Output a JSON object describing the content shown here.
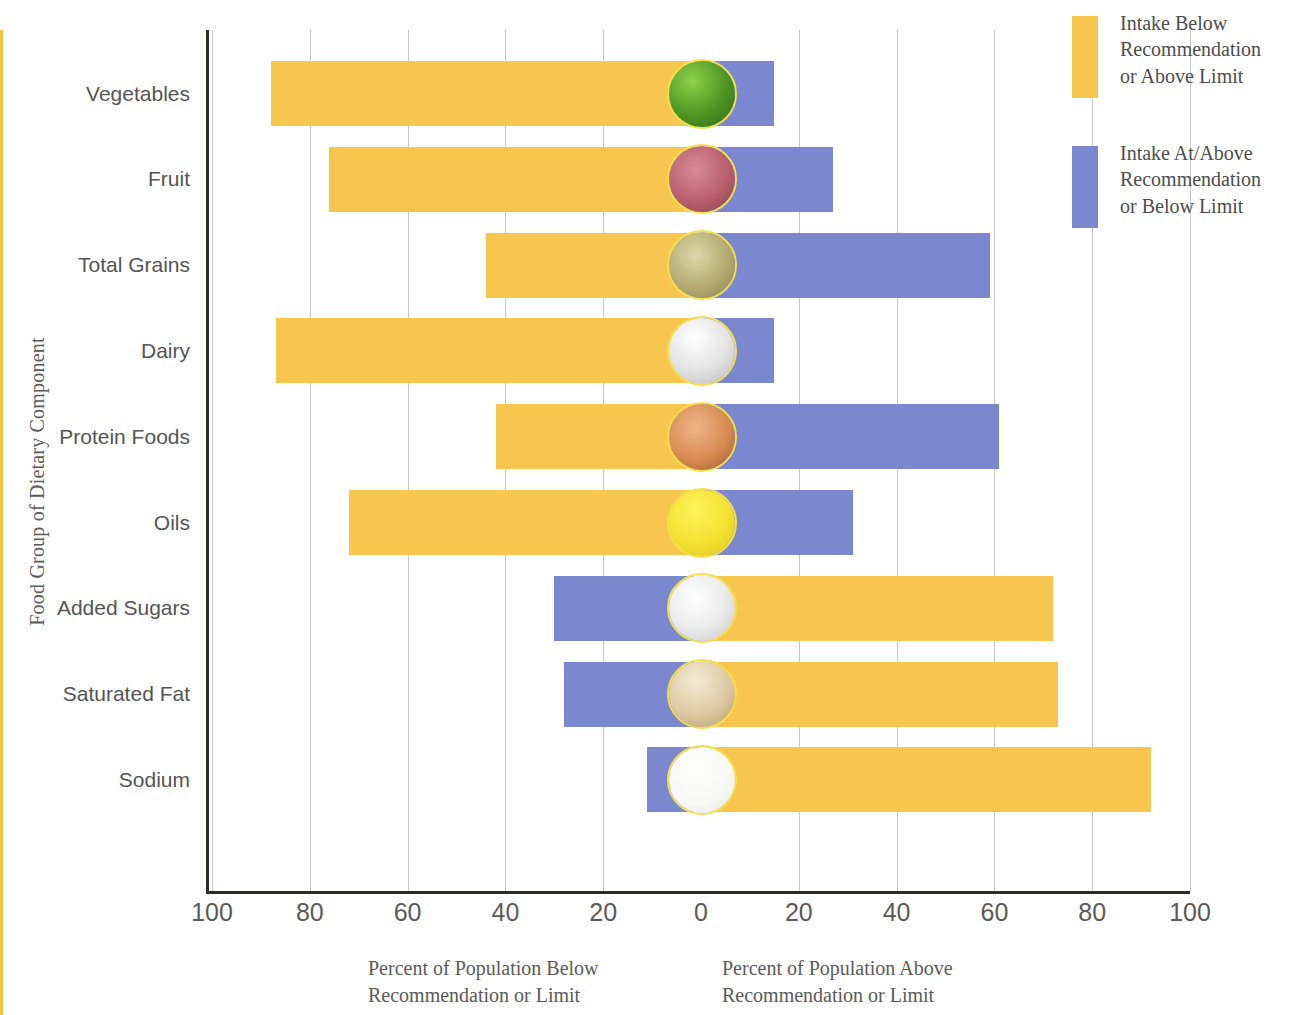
{
  "axes": {
    "y_title": "Food Group of Dietary Component",
    "x_ticks": [
      "100",
      "80",
      "60",
      "40",
      "20",
      "0",
      "20",
      "40",
      "60",
      "80",
      "100"
    ],
    "x_caption_left_line1": "Percent of Population Below",
    "x_caption_left_line2": "Recommendation or Limit",
    "x_caption_right_line1": "Percent of Population Above",
    "x_caption_right_line2": "Recommendation or Limit"
  },
  "legend": {
    "items": [
      {
        "label": "Intake Below Recommendation or Above Limit",
        "line1": "Intake Below",
        "line2": "Recommendation",
        "line3": "or Above Limit",
        "color": "#f7c64e",
        "swatch": "below-swatch"
      },
      {
        "label": "Intake At/Above Recommendation or Below Limit",
        "line1": "Intake At/Above",
        "line2": "Recommendation",
        "line3": "or Below Limit",
        "color": "#7b87cf",
        "swatch": "above-swatch"
      }
    ]
  },
  "colors": {
    "below": "#f7c64e",
    "above": "#7b87cf",
    "zero_line": "#f5c243",
    "grid": "#c9c9c9",
    "axis": "#2e2a26",
    "text": "#5a5a5a"
  },
  "chart_data": {
    "type": "bar",
    "orientation": "horizontal",
    "layout": "diverging",
    "title": "",
    "xlabel": "Percent of Population",
    "ylabel": "Food Group of Dietary Component",
    "xlim": [
      -100,
      100
    ],
    "xticks": [
      -100,
      -80,
      -60,
      -40,
      -20,
      0,
      20,
      40,
      60,
      80,
      100
    ],
    "grid": true,
    "legend_position": "right",
    "categories": [
      "Vegetables",
      "Fruit",
      "Total Grains",
      "Dairy",
      "Protein Foods",
      "Oils",
      "Added Sugars",
      "Saturated Fat",
      "Sodium"
    ],
    "series": [
      {
        "name": "Intake Below Recommendation or Above Limit",
        "color": "#f7c64e",
        "values": [
          88,
          76,
          44,
          87,
          42,
          72,
          72,
          73,
          92
        ]
      },
      {
        "name": "Intake At/Above Recommendation or Below Limit",
        "color": "#7b87cf",
        "values": [
          15,
          27,
          59,
          15,
          61,
          31,
          30,
          28,
          11
        ]
      }
    ],
    "bars": [
      {
        "category": "Vegetables",
        "below": 88,
        "above": 15,
        "below_side": "left",
        "above_side": "right",
        "icon": "broccoli-icon"
      },
      {
        "category": "Fruit",
        "below": 76,
        "above": 27,
        "below_side": "left",
        "above_side": "right",
        "icon": "raspberries-icon"
      },
      {
        "category": "Total Grains",
        "below": 44,
        "above": 59,
        "below_side": "left",
        "above_side": "right",
        "icon": "grains-icon"
      },
      {
        "category": "Dairy",
        "below": 87,
        "above": 15,
        "below_side": "left",
        "above_side": "right",
        "icon": "milk-icon"
      },
      {
        "category": "Protein Foods",
        "below": 42,
        "above": 61,
        "below_side": "left",
        "above_side": "right",
        "icon": "meat-icon"
      },
      {
        "category": "Oils",
        "below": 72,
        "above": 31,
        "below_side": "left",
        "above_side": "right",
        "icon": "oil-icon"
      },
      {
        "category": "Added Sugars",
        "below": 72,
        "above": 30,
        "below_side": "right",
        "above_side": "left",
        "icon": "sugar-icon"
      },
      {
        "category": "Saturated Fat",
        "below": 73,
        "above": 28,
        "below_side": "right",
        "above_side": "left",
        "icon": "butter-icon"
      },
      {
        "category": "Sodium",
        "below": 92,
        "above": 11,
        "below_side": "right",
        "above_side": "left",
        "icon": "salt-icon"
      }
    ]
  }
}
